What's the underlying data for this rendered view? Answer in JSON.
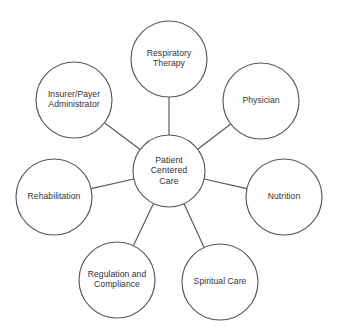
{
  "diagram": {
    "type": "hub-and-spoke",
    "colors": {
      "background": "#fefefe",
      "node_stroke": "#58585a",
      "node_fill": "#fefefe",
      "text": "#333335"
    },
    "center": {
      "id": "patient-centered-care",
      "lines": [
        "Patient",
        "Centered",
        "Care"
      ],
      "cx": 169,
      "cy": 171,
      "r": 36
    },
    "spokes": [
      {
        "id": "respiratory-therapy",
        "lines": [
          "Respiratory",
          "Therapy"
        ],
        "cx": 169,
        "cy": 59,
        "r": 38
      },
      {
        "id": "physician",
        "lines": [
          "Physician"
        ],
        "cx": 261,
        "cy": 101,
        "r": 38
      },
      {
        "id": "nutrition",
        "lines": [
          "Nutrition"
        ],
        "cx": 284,
        "cy": 197,
        "r": 38
      },
      {
        "id": "spiritual-care",
        "lines": [
          "Spiritual Care"
        ],
        "cx": 220,
        "cy": 282,
        "r": 38
      },
      {
        "id": "regulation-and-compliance",
        "lines": [
          "Regulation and",
          "Compliance"
        ],
        "cx": 117,
        "cy": 280,
        "r": 38
      },
      {
        "id": "rehabilitation",
        "lines": [
          "Rehabilitation"
        ],
        "cx": 54,
        "cy": 197,
        "r": 38
      },
      {
        "id": "insurer-payer-administrator",
        "lines": [
          "Insurer/Payer",
          "Administrator"
        ],
        "cx": 74,
        "cy": 100,
        "r": 38
      }
    ]
  }
}
